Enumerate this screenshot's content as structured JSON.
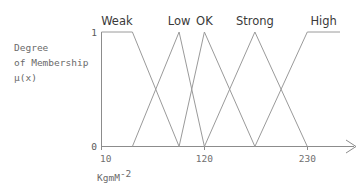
{
  "chart_data": {
    "type": "line",
    "title": "",
    "subtitle": "",
    "xlabel": "KgmM",
    "xlabel_superscript": "-2",
    "ylabel_lines": [
      "Degree",
      "of Membership",
      "μ(x)"
    ],
    "grid": false,
    "legend": "inline-above-peaks",
    "xlim": [
      10,
      265
    ],
    "ylim": [
      0,
      1
    ],
    "xticks": [
      "10",
      "120",
      "230"
    ],
    "xtick_values": [
      10,
      120,
      230
    ],
    "yticks": [
      "0",
      "1"
    ],
    "ytick_values": [
      0,
      1
    ],
    "series": [
      {
        "name": "Weak",
        "shape": "trapezoid",
        "x": [
          10,
          43,
          93
        ],
        "values": [
          1,
          1,
          0
        ]
      },
      {
        "name": "Low",
        "shape": "triangle",
        "x": [
          43,
          93,
          120
        ],
        "values": [
          0,
          1,
          0
        ]
      },
      {
        "name": "OK",
        "shape": "triangle",
        "x": [
          93,
          120,
          174
        ],
        "values": [
          0,
          1,
          0
        ]
      },
      {
        "name": "Strong",
        "shape": "triangle",
        "x": [
          120,
          174,
          230
        ],
        "values": [
          0,
          1,
          0
        ]
      },
      {
        "name": "High",
        "shape": "trapezoid",
        "x": [
          174,
          230,
          265
        ],
        "values": [
          0,
          1,
          1
        ]
      }
    ],
    "colors": {
      "line": "#9a9a9a",
      "axis": "#8c8c8c",
      "label_text": "#3a3a3a",
      "tick_text": "#6f6f6f",
      "background": "#ffffff"
    }
  },
  "labels": {
    "weak": "Weak",
    "low": "Low",
    "ok": "OK",
    "strong": "Strong",
    "high": "High"
  },
  "axis": {
    "y_line1": "Degree",
    "y_line2": "of Membership",
    "y_line3": "μ(x)",
    "y_top": "1",
    "y_bottom": "0",
    "x_tick_1": "10",
    "x_tick_2": "120",
    "x_tick_3": "230",
    "x_caption": "KgmM",
    "x_caption_sup": "-2"
  }
}
